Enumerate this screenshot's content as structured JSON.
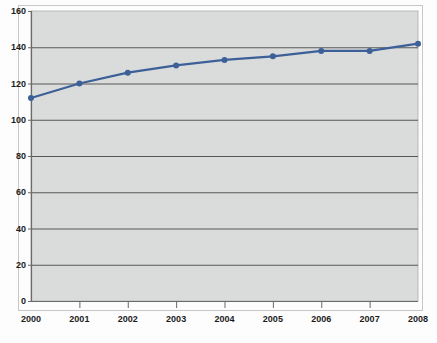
{
  "chart_data": {
    "type": "line",
    "title": "",
    "subtitle": "",
    "xlabel": "",
    "ylabel": "",
    "categories": [
      "2000",
      "2001",
      "2002",
      "2003",
      "2004",
      "2005",
      "2006",
      "2007",
      "2008"
    ],
    "x": [
      2000,
      2001,
      2002,
      2003,
      2004,
      2005,
      2006,
      2007,
      2008
    ],
    "values": [
      112,
      120,
      126,
      130,
      133,
      135,
      138,
      138,
      142
    ],
    "series": [
      {
        "name": "",
        "values": [
          112,
          120,
          126,
          130,
          133,
          135,
          138,
          138,
          142
        ]
      }
    ],
    "ylim": [
      0,
      160
    ],
    "y_ticks": [
      0,
      20,
      40,
      60,
      80,
      100,
      120,
      140,
      160
    ],
    "y_tick_labels": [
      "0",
      "20",
      "40",
      "60",
      "80",
      "100",
      "120",
      "140",
      "160"
    ],
    "x_tick_labels": [
      "2000",
      "2001",
      "2002",
      "2003",
      "2004",
      "2005",
      "2006",
      "2007",
      "2008"
    ],
    "grid": "horizontal",
    "legend": "none",
    "annotations": [],
    "markers": "circle"
  },
  "style": {
    "plot_background": "#dcdedd",
    "page_background": "#ffffff",
    "gridline_color": "#585858",
    "axis_color": "#6b6b6b",
    "border_color": "#b9bcbb",
    "series_color": "#3d6199",
    "marker_color": "#3d6199",
    "tick_label_color": "#1c1c1c"
  }
}
